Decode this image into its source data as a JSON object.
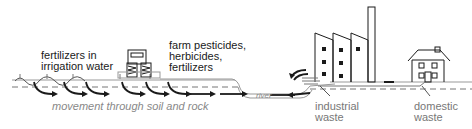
{
  "diagram": {
    "type": "water pollution sources",
    "labels": {
      "fertilizers_irrigation": "fertilizers in\nirrigation water",
      "farm_chemicals": "farm pesticides,\nherbicides,\nfertilizers",
      "movement": "movement through soil and rock",
      "river": "river",
      "industrial": "industrial\nwaste",
      "domestic": "domestic\nwaste"
    },
    "elements": [
      "irrigation sprinklers",
      "tractor",
      "river",
      "factory",
      "chimney",
      "house",
      "flow arrows"
    ],
    "colors": {
      "line": "#1a1a1a",
      "text": "#1a1a1a",
      "gray_text": "#777777",
      "background": "#ffffff"
    }
  }
}
